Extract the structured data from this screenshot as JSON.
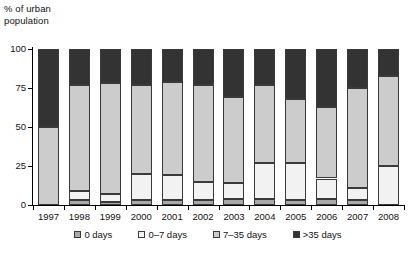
{
  "chart_data": {
    "type": "bar",
    "stacked": true,
    "title": "",
    "xlabel": "",
    "ylabel": "% of urban\npopulation",
    "ylim": [
      0,
      100
    ],
    "yticks": [
      0,
      25,
      50,
      75,
      100
    ],
    "grid": false,
    "legend_position": "bottom",
    "categories": [
      "1997",
      "1998",
      "1999",
      "2000",
      "2001",
      "2002",
      "2003",
      "2004",
      "2005",
      "2006",
      "2007",
      "2008"
    ],
    "series": [
      {
        "name": "0 days",
        "color": "#a9a9a9",
        "values": [
          0,
          3,
          2,
          3,
          3,
          3,
          4,
          4,
          3,
          4,
          3,
          0
        ]
      },
      {
        "name": "0–7 days",
        "color": "#f2f2f2",
        "values": [
          0,
          6,
          5,
          17,
          16,
          12,
          10,
          23,
          24,
          13,
          8,
          25
        ]
      },
      {
        "name": "7–35 days",
        "color": "#cccccc",
        "values": [
          50,
          68,
          71,
          57,
          60,
          62,
          55,
          50,
          41,
          46,
          64,
          58
        ]
      },
      {
        "name": ">35 days",
        "color": "#333333",
        "values": [
          50,
          23,
          22,
          23,
          21,
          23,
          31,
          23,
          32,
          37,
          25,
          17
        ]
      }
    ]
  },
  "axis": {
    "y_title": "% of urban\npopulation",
    "tick_labels": [
      "100",
      "75",
      "50",
      "25",
      "0"
    ]
  },
  "legend": {
    "items": [
      {
        "label": "0 days",
        "color": "#a9a9a9"
      },
      {
        "label": "0–7 days",
        "color": "#f2f2f2"
      },
      {
        "label": "7–35 days",
        "color": "#cccccc"
      },
      {
        "label": ">35 days",
        "color": "#333333"
      }
    ]
  }
}
